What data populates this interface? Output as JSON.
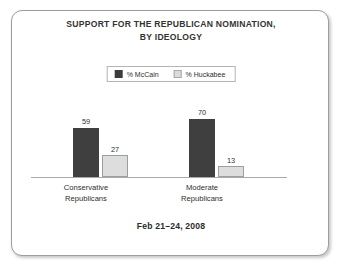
{
  "chart_data": {
    "type": "bar",
    "title": "SUPPORT FOR THE REPUBLICAN NOMINATION, BY IDEOLOGY",
    "title_lines": [
      "SUPPORT FOR THE REPUBLICAN NOMINATION,",
      "BY IDEOLOGY"
    ],
    "subtitle": "",
    "footer": "Feb 21–24, 2008",
    "xlabel": "",
    "ylabel": "",
    "ylim": [
      0,
      100
    ],
    "grid": false,
    "legend_position": "top-center",
    "categories": [
      "Conservative Republicans",
      "Moderate Republicans"
    ],
    "category_lines": [
      [
        "Conservative",
        "Republicans"
      ],
      [
        "Moderate",
        "Republicans"
      ]
    ],
    "series": [
      {
        "name": "% McCain",
        "color": "#3f3f3f",
        "values": [
          59,
          70
        ]
      },
      {
        "name": "% Huckabee",
        "color": "#dddddd",
        "values": [
          27,
          13
        ]
      }
    ]
  },
  "legend": {
    "entries": [
      {
        "label": "% McCain",
        "swatch": "dark-swatch-icon"
      },
      {
        "label": "% Huckabee",
        "swatch": "light-swatch-icon"
      }
    ]
  },
  "colors": {
    "bar_dark": "#3f3f3f",
    "bar_light": "#dddddd",
    "bar_light_border": "#9e9e9e",
    "frame_border": "#9d9d9d",
    "axis": "#a9a9a9",
    "text": "#2e2e2e",
    "background": "#ffffff"
  }
}
